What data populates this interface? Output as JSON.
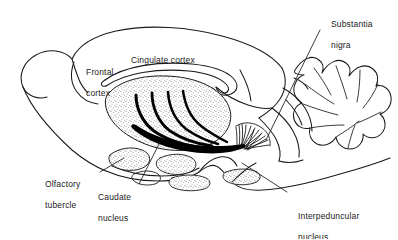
{
  "figure": {
    "type": "anatomical-line-diagram",
    "background_color": "#ffffff",
    "ink_color": "#1a1a1a",
    "stipple_color": "#3a3a3a",
    "fiber_color": "#000000"
  },
  "labels": {
    "frontal_cortex": {
      "line1": "Frontal",
      "line2": "cortex"
    },
    "cingulate_cortex": {
      "line1": "Cingulate cortex"
    },
    "substantia_nigra": {
      "line1": "Substantia",
      "line2": "nigra"
    },
    "olfactory_tubercle": {
      "line1": "Olfactory",
      "line2": "tubercle"
    },
    "caudate_nucleus": {
      "line1": "Caudate",
      "line2": "nucleus"
    },
    "interpeduncular_nucleus": {
      "line1": "Interpeduncular",
      "line2": "nucleus"
    }
  },
  "structures": [
    {
      "name": "olfactory-bulb",
      "labelled": false
    },
    {
      "name": "frontal-cortex",
      "labelled": true
    },
    {
      "name": "cingulate-cortex",
      "labelled": true
    },
    {
      "name": "corpus-callosum",
      "labelled": false
    },
    {
      "name": "caudate-nucleus",
      "labelled": true,
      "texture": "stipple"
    },
    {
      "name": "nigrostriatal-fiber-bundles",
      "labelled": false,
      "count": 4
    },
    {
      "name": "substantia-nigra",
      "labelled": true,
      "texture": "fiber-fan"
    },
    {
      "name": "olfactory-tubercle",
      "labelled": true,
      "texture": "stipple"
    },
    {
      "name": "interpeduncular-nucleus",
      "labelled": true
    },
    {
      "name": "cerebellum",
      "labelled": false
    }
  ]
}
